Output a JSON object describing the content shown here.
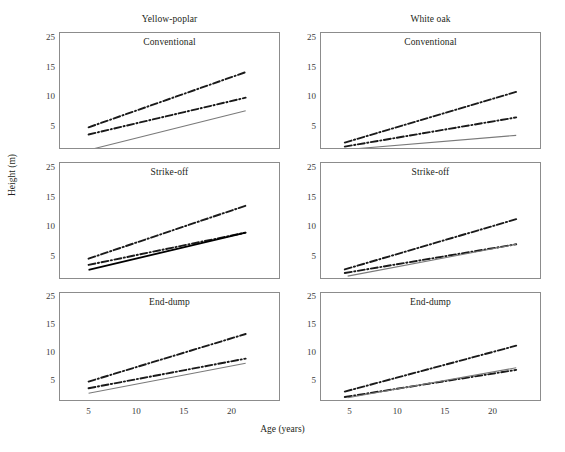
{
  "figure": {
    "y_axis_title": "Height (m)",
    "x_axis_title": "Age (years)",
    "columns": [
      {
        "title": "Yellow-poplar"
      },
      {
        "title": "White oak"
      }
    ],
    "row_titles": [
      "Conventional",
      "Strike-off",
      "End-dump"
    ],
    "y_ticks": [
      "25",
      "15",
      "10",
      "5"
    ],
    "x_ticks": [
      "5",
      "10",
      "15",
      "20"
    ],
    "colors": {
      "frame": "#8c8c8c",
      "solid_gray_line": "#7a7a7a",
      "dashdot_black_line": "#1a1a1a",
      "solid_black_line": "#000000",
      "text": "#231f20",
      "background": "#ffffff"
    }
  },
  "chart_data": {
    "type": "line",
    "xlabel": "Age (years)",
    "ylabel": "Height (m)",
    "xlim": [
      2,
      25
    ],
    "ylim": [
      0,
      25
    ],
    "xticks": [
      5,
      10,
      15,
      20
    ],
    "yticks": [
      25,
      15,
      10,
      5
    ],
    "grid": false,
    "legend": "none",
    "panels": [
      {
        "column": "Yellow-poplar",
        "row": "Conventional",
        "series": [
          {
            "name": "upper-dash-dot",
            "style": "dash-dot",
            "color": "#1a1a1a",
            "x": [
              5,
              21.5
            ],
            "y": [
              5.0,
              17.3
            ]
          },
          {
            "name": "middle-dash-dot",
            "style": "dash-dot",
            "color": "#1a1a1a",
            "x": [
              5,
              21.5
            ],
            "y": [
              3.4,
              11.6
            ]
          },
          {
            "name": "lower-solid-gray",
            "style": "solid",
            "color": "#7a7a7a",
            "x": [
              5.5,
              21.5
            ],
            "y": [
              0.2,
              8.7
            ]
          }
        ]
      },
      {
        "column": "Yellow-poplar",
        "row": "Strike-off",
        "series": [
          {
            "name": "upper-dash-dot",
            "style": "dash-dot",
            "color": "#1a1a1a",
            "x": [
              5,
              21.5
            ],
            "y": [
              4.7,
              16.5
            ]
          },
          {
            "name": "middle-dash-dot",
            "style": "dash-dot",
            "color": "#1a1a1a",
            "x": [
              5,
              21.5
            ],
            "y": [
              3.3,
              10.5
            ]
          },
          {
            "name": "lower-solid-black",
            "style": "solid",
            "color": "#000000",
            "x": [
              5,
              21.5
            ],
            "y": [
              2.2,
              10.5
            ]
          }
        ]
      },
      {
        "column": "Yellow-poplar",
        "row": "End-dump",
        "series": [
          {
            "name": "upper-dash-dot",
            "style": "dash-dot",
            "color": "#1a1a1a",
            "x": [
              5,
              21.5
            ],
            "y": [
              4.8,
              16.2
            ]
          },
          {
            "name": "middle-dash-dot",
            "style": "dash-dot",
            "color": "#1a1a1a",
            "x": [
              5,
              21.5
            ],
            "y": [
              3.2,
              10.3
            ]
          },
          {
            "name": "lower-solid-gray",
            "style": "solid",
            "color": "#7a7a7a",
            "x": [
              5,
              21.5
            ],
            "y": [
              2.0,
              9.2
            ]
          }
        ]
      },
      {
        "column": "White oak",
        "row": "Conventional",
        "series": [
          {
            "name": "upper-dash-dot",
            "style": "dash-dot",
            "color": "#1a1a1a",
            "x": [
              4.5,
              22.5
            ],
            "y": [
              1.6,
              12.9
            ]
          },
          {
            "name": "middle-dash-dot",
            "style": "dash-dot",
            "color": "#1a1a1a",
            "x": [
              4.5,
              22.5
            ],
            "y": [
              0.7,
              7.2
            ]
          },
          {
            "name": "lower-solid-gray",
            "style": "solid",
            "color": "#7a7a7a",
            "x": [
              5.0,
              22.5
            ],
            "y": [
              0.1,
              3.2
            ]
          }
        ]
      },
      {
        "column": "White oak",
        "row": "Strike-off",
        "series": [
          {
            "name": "upper-dash-dot",
            "style": "dash-dot",
            "color": "#1a1a1a",
            "x": [
              4.5,
              22.5
            ],
            "y": [
              2.3,
              13.5
            ]
          },
          {
            "name": "middle-dash-dot",
            "style": "dash-dot",
            "color": "#1a1a1a",
            "x": [
              4.5,
              22.5
            ],
            "y": [
              1.5,
              7.9
            ]
          },
          {
            "name": "lower-solid-gray",
            "style": "solid",
            "color": "#7a7a7a",
            "x": [
              4.8,
              22.5
            ],
            "y": [
              0.8,
              7.9
            ]
          }
        ]
      },
      {
        "column": "White oak",
        "row": "End-dump",
        "series": [
          {
            "name": "upper-dash-dot",
            "style": "dash-dot",
            "color": "#1a1a1a",
            "x": [
              4.5,
              22.5
            ],
            "y": [
              2.4,
              13.4
            ]
          },
          {
            "name": "middle-dash-dot",
            "style": "dash-dot",
            "color": "#1a1a1a",
            "x": [
              4.5,
              22.5
            ],
            "y": [
              1.1,
              7.6
            ]
          },
          {
            "name": "lower-solid-gray",
            "style": "solid",
            "color": "#7a7a7a",
            "x": [
              4.8,
              22.5
            ],
            "y": [
              0.9,
              8.1
            ]
          }
        ]
      }
    ]
  }
}
